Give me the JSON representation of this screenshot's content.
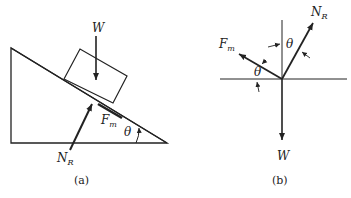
{
  "figure": {
    "panel_a": {
      "caption": "(a)",
      "labels": {
        "weight": "W",
        "normal_main": "N",
        "normal_sub": "R",
        "friction_main": "F",
        "friction_sub": "m",
        "angle": "θ"
      }
    },
    "panel_b": {
      "caption": "(b)",
      "labels": {
        "weight": "W",
        "normal_main": "N",
        "normal_sub": "R",
        "friction_main": "F",
        "friction_sub": "m",
        "angle_vertical": "θ",
        "angle_horizontal": "θ"
      }
    },
    "colors": {
      "line": "#222222",
      "background": "#ffffff"
    }
  }
}
